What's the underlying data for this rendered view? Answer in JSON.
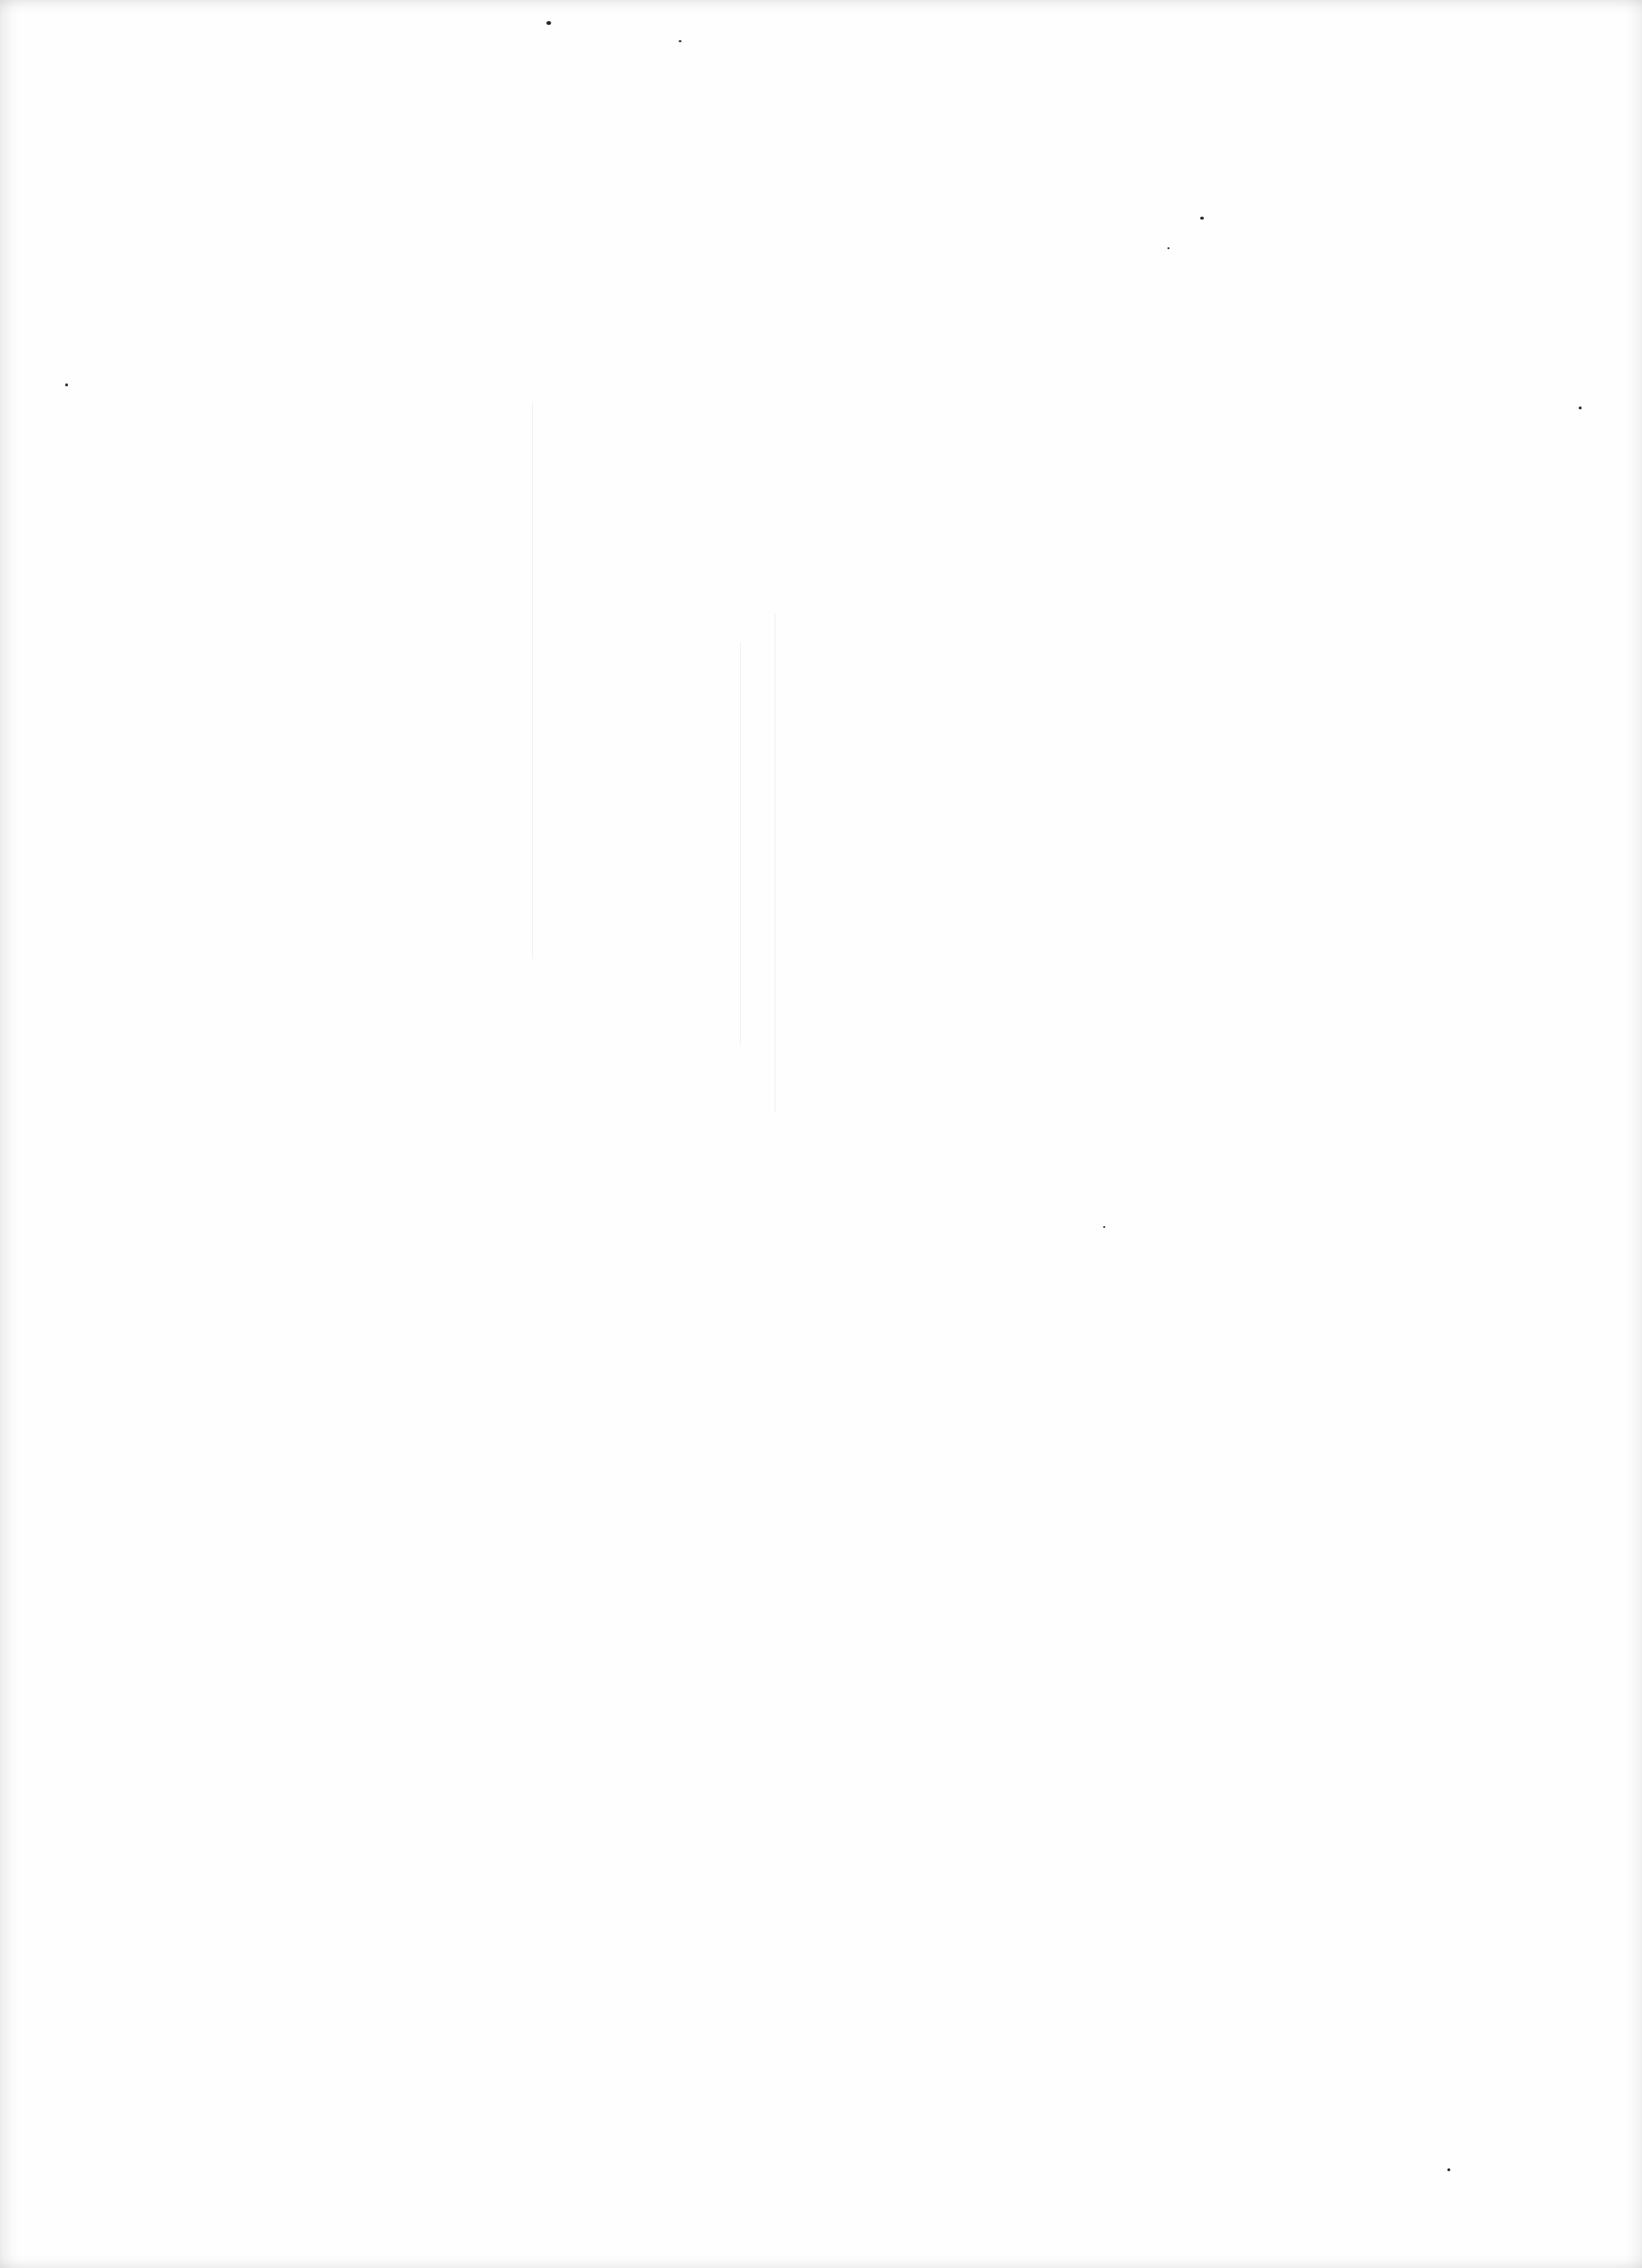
{
  "page": {
    "type": "blank-scanned-page",
    "text": ""
  }
}
